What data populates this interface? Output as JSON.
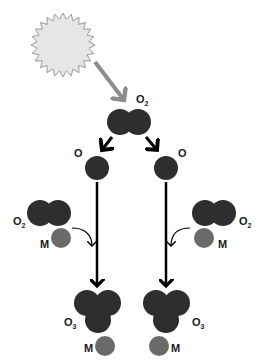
{
  "diagram": {
    "colors": {
      "molecule": "#2e2e2e",
      "third_body": "#6a6a6a",
      "sun_fill": "#e6e6e6",
      "sun_stroke": "#9a9a9a",
      "uv_arrow": "#8c8c8c",
      "reaction_arrow": "#000000"
    },
    "nodes": {
      "sun": {
        "label": "",
        "icon": "sun-icon"
      },
      "o2_top": {
        "label": "O",
        "sub": "2"
      },
      "o_left": {
        "label": "O"
      },
      "o_right": {
        "label": "O"
      },
      "o2_left": {
        "label": "O",
        "sub": "2"
      },
      "o2_right": {
        "label": "O",
        "sub": "2"
      },
      "m_left": {
        "label": "M"
      },
      "m_right": {
        "label": "M"
      },
      "o3_left": {
        "label": "O",
        "sub": "3"
      },
      "o3_right": {
        "label": "O",
        "sub": "3"
      },
      "m_bottom_left": {
        "label": "M"
      },
      "m_bottom_right": {
        "label": "M"
      }
    },
    "edges": [
      {
        "from": "sun",
        "to": "o2_top",
        "style": "uv"
      },
      {
        "from": "o2_top",
        "to": "o_left"
      },
      {
        "from": "o2_top",
        "to": "o_right"
      },
      {
        "from": "o_left",
        "to": "o3_left"
      },
      {
        "from": "o_right",
        "to": "o3_right"
      },
      {
        "from": "o2_left",
        "to": "o3_left",
        "style": "curved"
      },
      {
        "from": "o2_right",
        "to": "o3_right",
        "style": "curved"
      }
    ]
  }
}
